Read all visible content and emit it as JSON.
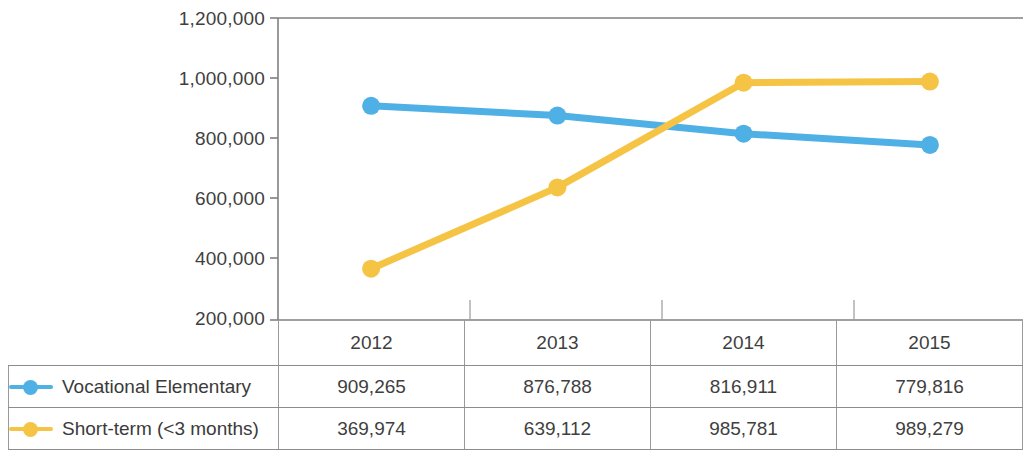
{
  "chart_data": {
    "type": "line",
    "title": "",
    "xlabel": "",
    "ylabel": "",
    "categories": [
      "2012",
      "2013",
      "2014",
      "2015"
    ],
    "ylim": [
      200000,
      1200000
    ],
    "ytick_labels": [
      "1,200,000",
      "1,000,000",
      "800,000",
      "600,000",
      "400,000",
      "200,000"
    ],
    "ytick_values": [
      1200000,
      1000000,
      800000,
      600000,
      400000,
      200000
    ],
    "grid": false,
    "legend_position": "table-left",
    "series": [
      {
        "name": "Vocational Elementary",
        "color": "#4FB0E5",
        "values": [
          909265,
          876788,
          816911,
          779816
        ],
        "labels": [
          "909,265",
          "876,788",
          "816,911",
          "779,816"
        ]
      },
      {
        "name": "Short-term (<3 months)",
        "color": "#F6C445",
        "values": [
          369974,
          639112,
          985781,
          989279
        ],
        "labels": [
          "369,974",
          "639,112",
          "985,781",
          "989,279"
        ]
      }
    ]
  },
  "table": {
    "header": [
      "",
      "2012",
      "2013",
      "2014",
      "2015"
    ],
    "rows": [
      {
        "label": "Vocational Elementary",
        "marker_icon": "line-marker-icon",
        "color": "#4FB0E5",
        "cells": [
          "909,265",
          "876,788",
          "816,911",
          "779,816"
        ]
      },
      {
        "label": "Short-term (<3 months)",
        "marker_icon": "line-marker-icon",
        "color": "#F6C445",
        "cells": [
          "369,974",
          "639,112",
          "985,781",
          "989,279"
        ]
      }
    ]
  },
  "colors": {
    "series_blue": "#4FB0E5",
    "series_yellow": "#F6C445",
    "axis": "#808080",
    "grid_border": "#8c8c8c",
    "text": "#3b3b3b",
    "background": "#ffffff"
  }
}
